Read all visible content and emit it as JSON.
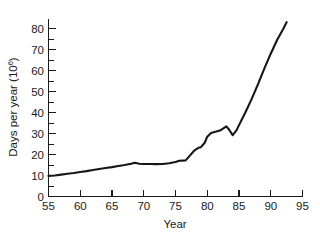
{
  "chart_data": {
    "type": "line",
    "title": "",
    "xlabel": "Year",
    "ylabel": "Days per year (10",
    "ylabel_superscript": "6",
    "ylabel_suffix": ")",
    "xlim": [
      55,
      95
    ],
    "ylim": [
      0,
      85
    ],
    "grid": false,
    "legend": null,
    "x_ticks": [
      55,
      60,
      65,
      70,
      75,
      80,
      85,
      90,
      95
    ],
    "x_tick_labels": [
      "55",
      "60",
      "65",
      "70",
      "75",
      "80",
      "85",
      "90",
      "95"
    ],
    "x_minor_step": 1,
    "y_ticks": [
      0,
      10,
      20,
      30,
      40,
      50,
      60,
      70,
      80
    ],
    "y_tick_labels": [
      "0",
      "10",
      "20",
      "30",
      "40",
      "50",
      "60",
      "70",
      "80"
    ],
    "y_minor_step": 5,
    "series": [
      {
        "name": "Days per year",
        "color": "#161616",
        "x": [
          55,
          56,
          57,
          58,
          59,
          60,
          61,
          62,
          63,
          64,
          65,
          66,
          67,
          68,
          68.6,
          69.3,
          70,
          71,
          72,
          73,
          74,
          75,
          75.6,
          76,
          76.6,
          77.3,
          78,
          78.6,
          79,
          79.6,
          80,
          80.6,
          81,
          82,
          82.6,
          83,
          83.4,
          84,
          84.6,
          85,
          86,
          87,
          88,
          89,
          90,
          91,
          92,
          92.5
        ],
        "y": [
          9.8,
          10.0,
          10.4,
          10.8,
          11.2,
          11.7,
          12.1,
          12.6,
          13.1,
          13.6,
          14.0,
          14.5,
          15.0,
          15.6,
          16.1,
          15.6,
          15.5,
          15.5,
          15.4,
          15.5,
          15.8,
          16.4,
          17.0,
          17.1,
          17.2,
          19.6,
          22.0,
          23.2,
          23.5,
          25.6,
          28.5,
          30.2,
          30.6,
          31.4,
          32.6,
          33.4,
          32.0,
          29.2,
          31.5,
          34.0,
          40.0,
          46.5,
          53.5,
          61.0,
          68.0,
          74.5,
          80.0,
          83.0
        ]
      }
    ],
    "units_note": "Days per year in units of 10^6"
  },
  "axis": {
    "x_title": "Year",
    "y_title_main": "Days per year (10",
    "y_title_sup": "6",
    "y_title_end": ")"
  }
}
